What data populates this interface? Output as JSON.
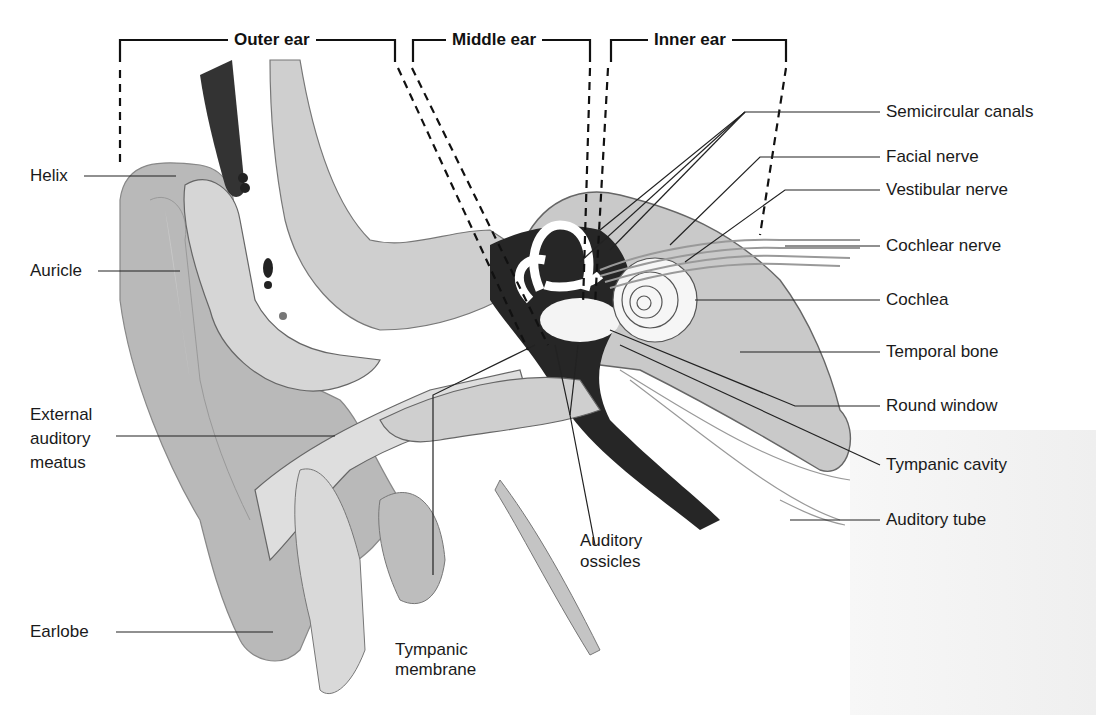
{
  "diagram": {
    "sections": [
      {
        "id": "outer",
        "label": "Outer ear"
      },
      {
        "id": "middle",
        "label": "Middle ear"
      },
      {
        "id": "inner",
        "label": "Inner ear"
      }
    ],
    "labels_left": [
      {
        "id": "helix",
        "text": "Helix"
      },
      {
        "id": "auricle",
        "text": "Auricle"
      },
      {
        "id": "external-auditory-meatus",
        "text": "External\nauditory\nmeatus"
      },
      {
        "id": "earlobe",
        "text": "Earlobe"
      }
    ],
    "labels_right": [
      {
        "id": "semicircular-canals",
        "text": "Semicircular canals"
      },
      {
        "id": "facial-nerve",
        "text": "Facial nerve"
      },
      {
        "id": "vestibular-nerve",
        "text": "Vestibular nerve"
      },
      {
        "id": "cochlear-nerve",
        "text": "Cochlear nerve"
      },
      {
        "id": "cochlea",
        "text": "Cochlea"
      },
      {
        "id": "temporal-bone",
        "text": "Temporal bone"
      },
      {
        "id": "round-window",
        "text": "Round window"
      },
      {
        "id": "tympanic-cavity",
        "text": "Tympanic cavity"
      },
      {
        "id": "auditory-tube",
        "text": "Auditory tube"
      }
    ],
    "labels_bottom": [
      {
        "id": "tympanic-membrane",
        "text": "Tympanic\nmembrane"
      },
      {
        "id": "auditory-ossicles",
        "text": "Auditory\nossicles"
      }
    ]
  }
}
